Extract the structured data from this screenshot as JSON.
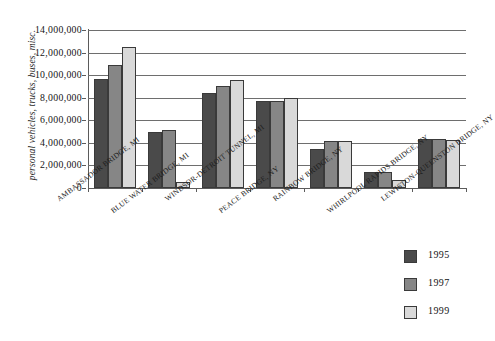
{
  "chart_data": {
    "type": "bar",
    "title": "",
    "xlabel": "",
    "ylabel": "personal vehicles, trucks, buses, misc.",
    "ylim": [
      0,
      14000000
    ],
    "yticks": [
      0,
      2000000,
      4000000,
      6000000,
      8000000,
      10000000,
      12000000,
      14000000
    ],
    "ytick_labels": [
      "0",
      "2,000,000",
      "4,000,000",
      "6,000,000",
      "8,000,000",
      "10,000,000",
      "12,000,000",
      "14,000,000"
    ],
    "grid": true,
    "legend_position": "lower-right",
    "categories": [
      "AMBASSADOR BRIDGE, MI",
      "BLUE WATER BRIDGE, MI",
      "WINDSOR-DETROIT TUNNEL, MI",
      "PEACE BRIDGE, NY",
      "RAINBOW BRIDGE, NY",
      "WHIRLPOOL RAPIDS BRIDGE, NY",
      "LEWISTON-QUEENSTON BRIDGE, NY"
    ],
    "series": [
      {
        "name": "1995",
        "color": "#4a4a4a",
        "values": [
          9700000,
          4950000,
          8400000,
          7700000,
          3500000,
          1450000,
          4300000
        ]
      },
      {
        "name": "1997",
        "color": "#868686",
        "values": [
          10900000,
          5150000,
          9000000,
          7700000,
          4200000,
          1400000,
          4300000
        ]
      },
      {
        "name": "1999",
        "color": "#d9d9d9",
        "values": [
          12500000,
          500000,
          9600000,
          8000000,
          4200000,
          700000,
          4250000
        ]
      }
    ]
  },
  "legend": {
    "entries": [
      {
        "label": "1995"
      },
      {
        "label": "1997"
      },
      {
        "label": "1999"
      }
    ]
  }
}
